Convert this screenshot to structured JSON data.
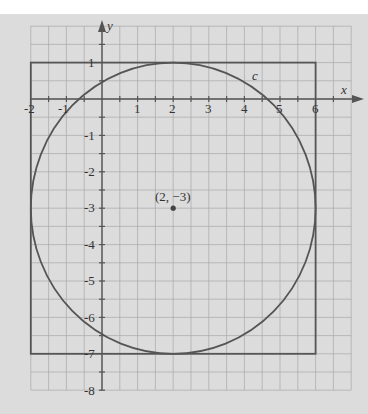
{
  "figure": {
    "axes": {
      "x_label": "x",
      "y_label": "y"
    },
    "x_ticks": [
      "-2",
      "-1",
      "1",
      "2",
      "3",
      "4",
      "5",
      "6"
    ],
    "y_ticks": [
      "1",
      "-1",
      "-2",
      "-3",
      "-4",
      "-5",
      "-6",
      "-7",
      "-8"
    ],
    "curve_label": "c",
    "center_label": "(2, −3)",
    "circle": {
      "center_x": 2,
      "center_y": -3,
      "radius": 4
    },
    "rectangle": {
      "x_min": -2,
      "x_max": 6,
      "y_min": -7,
      "y_max": 1
    },
    "colors": {
      "background": "#dcdcdc",
      "grid": "#a8a8a8",
      "stroke": "#555555"
    }
  }
}
